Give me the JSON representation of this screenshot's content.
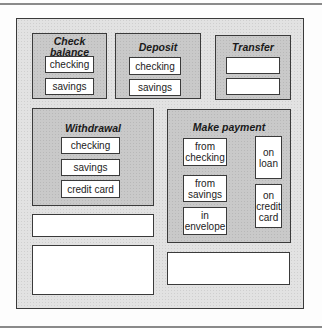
{
  "groups": {
    "check_balance": {
      "title": "Check balance",
      "buttons": [
        "checking",
        "savings"
      ]
    },
    "deposit": {
      "title": "Deposit",
      "buttons": [
        "checking",
        "savings"
      ]
    },
    "transfer": {
      "title": "Transfer"
    },
    "withdrawal": {
      "title": "Withdrawal",
      "buttons": [
        "checking",
        "savings",
        "credit card"
      ]
    },
    "make_payment": {
      "title": "Make payment",
      "buttons": [
        "from\nchecking",
        "from\nsavings",
        "in\nenvelope",
        "on\nloan",
        "on\ncredit\ncard"
      ]
    }
  }
}
